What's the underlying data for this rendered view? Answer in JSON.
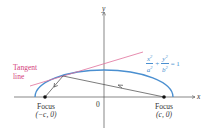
{
  "diagram": {
    "colors": {
      "ellipse": "#4a8fd0",
      "tangent": "#e0709a",
      "axes": "#555555",
      "rays": "#444444",
      "labels": "#333333",
      "tangent_label": "#d4407a",
      "equation": "#4a8fd0"
    },
    "axes": {
      "x_label": "x",
      "y_label": "y",
      "origin_label": "0"
    },
    "equation": {
      "term1_num": "x",
      "term1_den": "a",
      "term2_num": "y",
      "term2_den": "b",
      "exponent": "2",
      "plus": "+",
      "equals": "= 1"
    },
    "tangent": {
      "label_line1": "Tangent",
      "label_line2": "line"
    },
    "foci": [
      {
        "label": "Focus",
        "coords": "(−c, 0)"
      },
      {
        "label": "Focus",
        "coords": "(c, 0)"
      }
    ]
  }
}
